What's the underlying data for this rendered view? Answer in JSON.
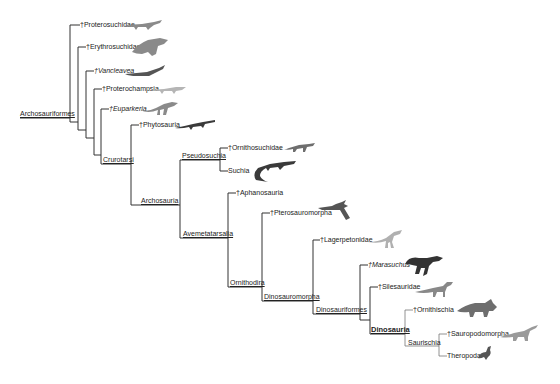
{
  "diagram": {
    "type": "cladogram",
    "root": "Archosauriformes",
    "line_color": "#333333",
    "silhouette_colors": {
      "dark": "#3a3a3a",
      "mid": "#6e6e6e",
      "light": "#a8a8a8"
    },
    "nodes": [
      {
        "id": "archosauriformes",
        "label": "Archosauriformes",
        "underlined": true
      },
      {
        "id": "crurotarsi",
        "label": "Crurotarsi",
        "underlined": true
      },
      {
        "id": "archosauria",
        "label": "Archosauria",
        "underlined": true
      },
      {
        "id": "pseudosuchia",
        "label": "Pseudosuchia",
        "underlined": true
      },
      {
        "id": "avemetatarsalia",
        "label": "Avemetatarsalia",
        "underlined": true
      },
      {
        "id": "ornithodira",
        "label": "Ornithodira",
        "underlined": true
      },
      {
        "id": "dinosauromorpha",
        "label": "Dinosauromorpha",
        "underlined": true
      },
      {
        "id": "dinosauriformes",
        "label": "Dinosauriformes",
        "underlined": true
      },
      {
        "id": "dinosauria",
        "label": "Dinosauria",
        "bold": true
      },
      {
        "id": "saurischia",
        "label": "Saurischia"
      }
    ],
    "leaves": [
      {
        "id": "proterosuchidae",
        "label": "†Proterosuchidae",
        "extinct": true
      },
      {
        "id": "erythrosuchidae",
        "label": "†Erythrosuchidae",
        "extinct": true
      },
      {
        "id": "vancleavea",
        "label": "†Vancleavea",
        "extinct": true,
        "italic": true
      },
      {
        "id": "proterochampsia",
        "label": "†Proterochampsia",
        "extinct": true
      },
      {
        "id": "euparkeria",
        "label": "†Euparkeria",
        "extinct": true,
        "italic": true
      },
      {
        "id": "phytosauria",
        "label": "†Phytosauria",
        "extinct": true
      },
      {
        "id": "ornithosuchidae",
        "label": "†Ornithosuchidae",
        "extinct": true
      },
      {
        "id": "suchia",
        "label": "Suchia",
        "extinct": false
      },
      {
        "id": "aphanosauria",
        "label": "†Aphanosauria",
        "extinct": true
      },
      {
        "id": "pterosauromorpha",
        "label": "†Pterosauromorpha",
        "extinct": true
      },
      {
        "id": "lagerpetonidae",
        "label": "†Lagerpetonidae",
        "extinct": true
      },
      {
        "id": "marasuchus",
        "label": "†Marasuchus",
        "extinct": true,
        "italic": true
      },
      {
        "id": "silesauridae",
        "label": "†Silesauridae",
        "extinct": true
      },
      {
        "id": "ornithischia",
        "label": "†Ornithischia",
        "extinct": true
      },
      {
        "id": "sauropodomorpha",
        "label": "†Sauropodomorpha",
        "extinct": true
      },
      {
        "id": "theropoda",
        "label": "Theropoda",
        "extinct": false
      }
    ]
  }
}
